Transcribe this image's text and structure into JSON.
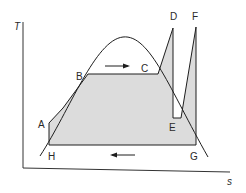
{
  "diagram": {
    "axes": {
      "y_label": "T",
      "x_label": "s"
    },
    "points": {
      "A": "A",
      "B": "B",
      "C": "C",
      "D": "D",
      "E": "E",
      "F": "F",
      "G": "G",
      "H": "H"
    },
    "colors": {
      "line": "#1e1e1e",
      "fill": "#dcdcdc",
      "background": "#ffffff"
    },
    "arrows": {
      "top": "right",
      "bottom": "left"
    }
  }
}
